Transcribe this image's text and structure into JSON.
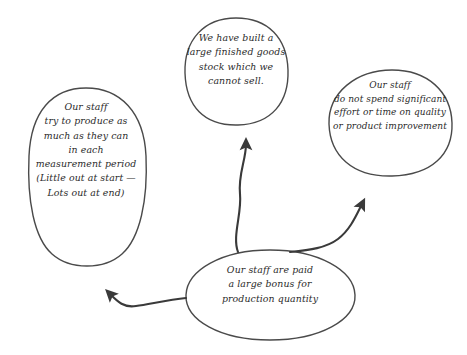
{
  "diagram": {
    "type": "causal-loop-bubble-diagram",
    "style": {
      "background": "#ffffff",
      "stroke": "#4a4a4a",
      "text_color": "#2b2b2b",
      "arrow_color": "#3a3a3a",
      "stroke_width": 1.4
    },
    "nodes": [
      {
        "id": "bonus-cause",
        "name": "root-cause-node",
        "shape": "ellipse",
        "text": "Our staff are paid\na large bonus for\nproduction quantity",
        "lines": [
          "Our staff are paid",
          "a large bonus for",
          "production quantity"
        ]
      },
      {
        "id": "incentive-overproduce",
        "name": "effect-node-overproduction",
        "shape": "ellipse",
        "text": "Our staff\ntry to produce as\nmuch as they can\nin each\nmeasurement period\n(Little out at start —\nLots out at end)",
        "lines": [
          "Our staff",
          "try to produce as",
          "much as they can",
          "in each",
          "measurement period",
          "(Little out at start —",
          "Lots out at end)"
        ]
      },
      {
        "id": "finished-goods",
        "name": "effect-node-excess-stock",
        "shape": "rounded-square",
        "text": "We have built a\nlarge finished goods\nstock which we\ncannot sell.",
        "lines": [
          "We have built a",
          "large finished goods",
          "stock which we",
          "cannot sell."
        ]
      },
      {
        "id": "quality-neglect",
        "name": "effect-node-quality-neglect",
        "shape": "rounded-square",
        "text": "Our staff\ndo not spend significant\neffort or time on quality\nor product improvement",
        "lines": [
          "Our staff",
          "do not spend significant",
          "effort or time on quality",
          "or product improvement"
        ]
      }
    ],
    "arrows": [
      {
        "id": "arrow-bonus-to-overproduce",
        "from": "bonus-cause",
        "to": "incentive-overproduce",
        "direction": "left"
      },
      {
        "id": "arrow-bonus-to-finished-goods",
        "from": "bonus-cause",
        "to": "finished-goods",
        "direction": "up"
      },
      {
        "id": "arrow-bonus-to-quality-neglect",
        "from": "bonus-cause",
        "to": "quality-neglect",
        "direction": "up-right"
      }
    ]
  }
}
